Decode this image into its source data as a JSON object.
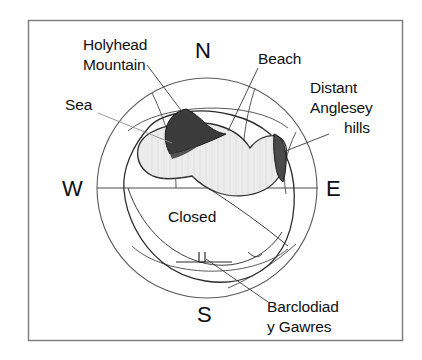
{
  "figure": {
    "type": "panorama-viewshed-diagram",
    "frame": {
      "border_color": "#7a7a7a",
      "background": "#ffffff"
    }
  },
  "compass": {
    "north": "N",
    "east": "E",
    "south": "S",
    "west": "W"
  },
  "labels": {
    "holyhead_mountain": {
      "line1": "Holyhead",
      "line2": "Mountain"
    },
    "sea": "Sea",
    "beach": "Beach",
    "distant_anglesey_hills": {
      "line1": "Distant",
      "line2": "Anglesey",
      "line3": "hills"
    },
    "closed": "Closed",
    "barclodiad": {
      "line1": "Barclodiad",
      "line2": "y Gawres"
    }
  },
  "colors": {
    "ink": "#111111",
    "outline": "#2b2b2b",
    "grid": "#5a5a5a",
    "leader": "#3a3a3a",
    "leader_faint": "#8f8f8f",
    "sea_fill": "#ececec",
    "hill_dark_fill": "#3b3b3b",
    "hill_mid_fill": "#6f6f6f",
    "frame": "#7a7a7a",
    "page_background": "#ffffff"
  }
}
